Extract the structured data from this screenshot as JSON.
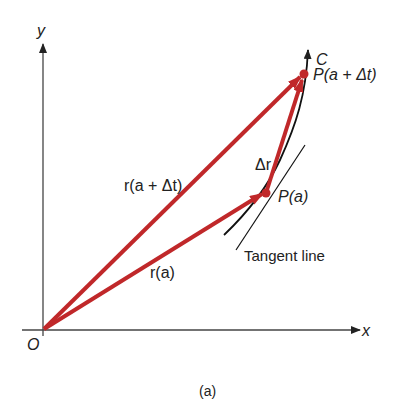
{
  "figure": {
    "caption": "(a)",
    "axes": {
      "y_label": "y",
      "x_label": "x",
      "origin_label": "O"
    },
    "curve_label": "C",
    "points": {
      "p_a": "P(a)",
      "p_a_dt": "P(a + Δt)"
    },
    "vectors": {
      "r_a": "r(a)",
      "r_a_dt": "r(a + Δt)",
      "delta_r": "Δr"
    },
    "tangent_label": "Tangent line",
    "colors": {
      "vector": "#c0282a",
      "axis": "#333333",
      "curve": "#111111"
    }
  }
}
